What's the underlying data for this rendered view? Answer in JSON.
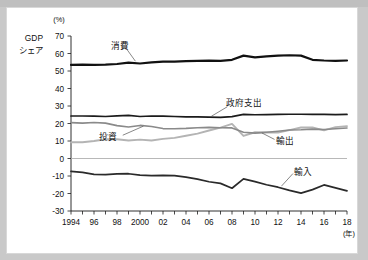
{
  "chart_data": {
    "type": "line",
    "title": "",
    "ylabel": "GDPシェア",
    "ylabel_lines": [
      "GDP",
      "シェア"
    ],
    "yunit": "(%)",
    "xlabel": "(年)",
    "ylim": [
      -30,
      70
    ],
    "yticks": [
      70,
      60,
      50,
      40,
      30,
      20,
      10,
      0,
      -10,
      -20,
      -30
    ],
    "ytick_labels": [
      "70",
      "60",
      "50",
      "40",
      "30",
      "20",
      "10",
      "0",
      "-10",
      "-20",
      "-30"
    ],
    "xlim": [
      1994,
      2018
    ],
    "x": [
      1994,
      1995,
      1996,
      1997,
      1998,
      1999,
      2000,
      2001,
      2002,
      2003,
      2004,
      2005,
      2006,
      2007,
      2008,
      2009,
      2010,
      2011,
      2012,
      2013,
      2014,
      2015,
      2016,
      2017,
      2018
    ],
    "xticks_labeled": [
      1994,
      1996,
      1998,
      2000,
      2002,
      2004,
      2006,
      2008,
      2010,
      2012,
      2014,
      2016,
      2018
    ],
    "xtick_labels": [
      "1994",
      "96",
      "98",
      "2000",
      "02",
      "04",
      "06",
      "08",
      "10",
      "12",
      "14",
      "16",
      "18"
    ],
    "grid": false,
    "legend": "inline-annotations",
    "series": [
      {
        "name": "消費",
        "name_en": "Consumption",
        "color": "#111111",
        "label_x": 1998.3,
        "label_y": 64.5,
        "values": [
          53.5,
          53.6,
          53.5,
          53.6,
          54.0,
          54.8,
          54.3,
          54.9,
          55.4,
          55.4,
          55.6,
          55.8,
          55.9,
          55.8,
          56.4,
          58.8,
          57.8,
          58.4,
          58.8,
          59.0,
          58.8,
          56.4,
          56.0,
          55.8,
          56.0
        ]
      },
      {
        "name": "政府支出",
        "name_en": "Government spending",
        "color": "#1b1b1b",
        "label_x": 2009.0,
        "label_y": 31.5,
        "values": [
          24.3,
          24.3,
          24.2,
          24.0,
          24.4,
          24.6,
          24.0,
          24.3,
          24.2,
          24.0,
          23.8,
          23.8,
          23.6,
          23.5,
          23.9,
          25.2,
          25.0,
          25.1,
          25.2,
          25.3,
          25.3,
          25.2,
          25.2,
          25.1,
          25.2
        ]
      },
      {
        "name": "投資",
        "name_en": "Investment",
        "color": "#8a8a8a",
        "label_x": 1997.2,
        "label_y": 12.5,
        "values": [
          20.5,
          20.2,
          20.6,
          20.2,
          18.8,
          18.0,
          18.9,
          18.3,
          17.1,
          17.0,
          17.2,
          17.6,
          17.8,
          17.6,
          17.5,
          15.0,
          14.5,
          15.0,
          15.6,
          16.3,
          16.4,
          16.8,
          16.6,
          17.0,
          17.4
        ]
      },
      {
        "name": "輸出",
        "name_en": "Exports",
        "color": "#b4b4b4",
        "label_x": 2012.6,
        "label_y": 10.0,
        "values": [
          9.3,
          9.3,
          10.0,
          11.0,
          11.0,
          10.3,
          10.8,
          10.3,
          11.2,
          11.8,
          13.0,
          14.2,
          16.0,
          17.6,
          19.8,
          12.9,
          15.0,
          14.9,
          14.8,
          16.2,
          17.7,
          17.8,
          16.1,
          17.9,
          18.5
        ]
      },
      {
        "name": "輸入",
        "name_en": "Imports",
        "color": "#2a2a2a",
        "label_x": 2014.2,
        "label_y": -7.5,
        "values": [
          -7.3,
          -7.9,
          -9.1,
          -9.2,
          -8.8,
          -8.7,
          -9.5,
          -9.8,
          -9.6,
          -9.8,
          -10.6,
          -11.8,
          -13.3,
          -14.2,
          -17.0,
          -11.6,
          -13.2,
          -15.0,
          -16.4,
          -18.2,
          -19.8,
          -17.8,
          -15.1,
          -16.8,
          -18.5
        ]
      }
    ]
  }
}
